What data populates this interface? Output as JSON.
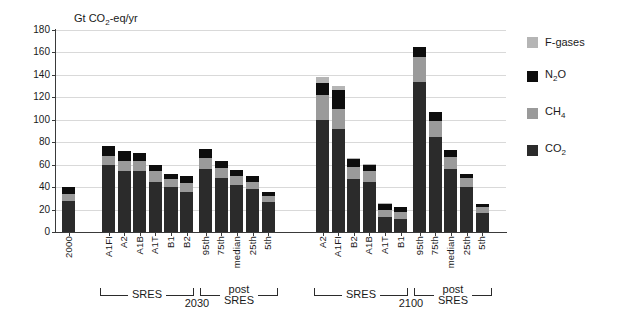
{
  "chart_data": {
    "type": "bar",
    "stacked": true,
    "title": "",
    "ylabel": "Gt CO2-eq/yr",
    "xlabel": "",
    "ylim": [
      0,
      180
    ],
    "ytick_values": [
      0,
      20,
      40,
      60,
      80,
      100,
      120,
      140,
      160,
      180
    ],
    "grid": true,
    "legend_position": "right",
    "legend": [
      {
        "name": "F-gases",
        "color": "#b5b5b5"
      },
      {
        "name": "N2O",
        "color": "#0d0d0d"
      },
      {
        "name": "CH4",
        "color": "#9a9a9a"
      },
      {
        "name": "CO2",
        "color": "#2b2b2b"
      }
    ],
    "series_order": [
      "CO2",
      "CH4",
      "N2O",
      "F-gases"
    ],
    "categories": [
      "2000",
      "A1FI",
      "A2",
      "A1B",
      "A1T",
      "B1",
      "B2",
      "95th",
      "75th",
      "median",
      "25th",
      "5th",
      "A2",
      "A1FI",
      "B2",
      "A1B",
      "A1T",
      "B1",
      "95th",
      "75th",
      "median",
      "25th",
      "5th"
    ],
    "bars": [
      {
        "label": "2000",
        "group": "base",
        "CO2": 28.0,
        "CH4": 6.0,
        "N2O": 6.0,
        "F-gases": 0.0,
        "total": 40.0
      },
      {
        "label": "A1FI",
        "group": "SRES 2030",
        "CO2": 60.0,
        "CH4": 8.0,
        "N2O": 9.0,
        "F-gases": 0.0,
        "total": 77.0
      },
      {
        "label": "A2",
        "group": "SRES 2030",
        "CO2": 54.0,
        "CH4": 9.0,
        "N2O": 9.0,
        "F-gases": 0.0,
        "total": 72.0
      },
      {
        "label": "A1B",
        "group": "SRES 2030",
        "CO2": 54.0,
        "CH4": 9.0,
        "N2O": 7.0,
        "F-gases": 0.0,
        "total": 70.0
      },
      {
        "label": "A1T",
        "group": "SRES 2030",
        "CO2": 45.0,
        "CH4": 9.0,
        "N2O": 6.0,
        "F-gases": 0.0,
        "total": 60.0
      },
      {
        "label": "B1",
        "group": "SRES 2030",
        "CO2": 40.0,
        "CH4": 7.0,
        "N2O": 5.0,
        "F-gases": 0.0,
        "total": 52.0
      },
      {
        "label": "B2",
        "group": "SRES 2030",
        "CO2": 36.0,
        "CH4": 8.0,
        "N2O": 6.0,
        "F-gases": 0.0,
        "total": 50.0
      },
      {
        "label": "95th",
        "group": "post-SRES 2030",
        "CO2": 56.0,
        "CH4": 10.0,
        "N2O": 8.0,
        "F-gases": 0.0,
        "total": 74.0
      },
      {
        "label": "75th",
        "group": "post-SRES 2030",
        "CO2": 48.0,
        "CH4": 9.0,
        "N2O": 6.0,
        "F-gases": 0.0,
        "total": 63.0
      },
      {
        "label": "median",
        "group": "post-SRES 2030",
        "CO2": 42.0,
        "CH4": 8.0,
        "N2O": 5.0,
        "F-gases": 0.0,
        "total": 55.0
      },
      {
        "label": "25th",
        "group": "post-SRES 2030",
        "CO2": 38.0,
        "CH4": 7.0,
        "N2O": 5.0,
        "F-gases": 0.0,
        "total": 50.0
      },
      {
        "label": "5th",
        "group": "post-SRES 2030",
        "CO2": 27.0,
        "CH4": 5.0,
        "N2O": 4.0,
        "F-gases": 0.0,
        "total": 36.0
      },
      {
        "label": "A2",
        "group": "SRES 2100",
        "CO2": 100.0,
        "CH4": 22.0,
        "N2O": 11.0,
        "F-gases": 5.0,
        "total": 138.0
      },
      {
        "label": "A1FI",
        "group": "SRES 2100",
        "CO2": 92.0,
        "CH4": 18.0,
        "N2O": 17.0,
        "F-gases": 3.0,
        "total": 130.0
      },
      {
        "label": "B2",
        "group": "SRES 2100",
        "CO2": 47.0,
        "CH4": 11.0,
        "N2O": 7.0,
        "F-gases": 1.0,
        "total": 66.0
      },
      {
        "label": "A1B",
        "group": "SRES 2100",
        "CO2": 45.0,
        "CH4": 9.0,
        "N2O": 6.0,
        "F-gases": 1.0,
        "total": 61.0
      },
      {
        "label": "A1T",
        "group": "SRES 2100",
        "CO2": 13.0,
        "CH4": 7.0,
        "N2O": 5.0,
        "F-gases": 1.0,
        "total": 26.0
      },
      {
        "label": "B1",
        "group": "SRES 2100",
        "CO2": 12.0,
        "CH4": 6.0,
        "N2O": 4.0,
        "F-gases": 0.0,
        "total": 22.0
      },
      {
        "label": "95th",
        "group": "post-SRES 2100",
        "CO2": 134.0,
        "CH4": 22.0,
        "N2O": 9.0,
        "F-gases": 0.0,
        "total": 165.0
      },
      {
        "label": "75th",
        "group": "post-SRES 2100",
        "CO2": 85.0,
        "CH4": 14.0,
        "N2O": 8.0,
        "F-gases": 0.0,
        "total": 107.0
      },
      {
        "label": "median",
        "group": "post-SRES 2100",
        "CO2": 56.0,
        "CH4": 11.0,
        "N2O": 6.0,
        "F-gases": 0.0,
        "total": 73.0
      },
      {
        "label": "25th",
        "group": "post-SRES 2100",
        "CO2": 40.0,
        "CH4": 8.0,
        "N2O": 4.0,
        "F-gases": 0.0,
        "total": 52.0
      },
      {
        "label": "5th",
        "group": "post-SRES 2100",
        "CO2": 17.0,
        "CH4": 5.0,
        "N2O": 3.0,
        "F-gases": 0.0,
        "total": 25.0
      }
    ],
    "annotations": [
      {
        "text": "SRES",
        "year": "2030",
        "post": "post\nSRES"
      },
      {
        "text": "SRES",
        "year": "2100",
        "post": "post\nSRES"
      }
    ]
  },
  "axis": {
    "y_label_main": "Gt CO",
    "y_label_sub": "2",
    "y_label_tail": "-eq/yr"
  },
  "brackets": {
    "sres_label": "SRES",
    "post_line1": "post",
    "post_line2": "SRES",
    "year_2030": "2030",
    "year_2100": "2100"
  },
  "legend": {
    "items": [
      {
        "label_main": "F-gases",
        "label_sub": "",
        "label_tail": ""
      },
      {
        "label_main": "N",
        "label_sub": "2",
        "label_tail": "O"
      },
      {
        "label_main": "CH",
        "label_sub": "4",
        "label_tail": ""
      },
      {
        "label_main": "CO",
        "label_sub": "2",
        "label_tail": ""
      }
    ]
  }
}
